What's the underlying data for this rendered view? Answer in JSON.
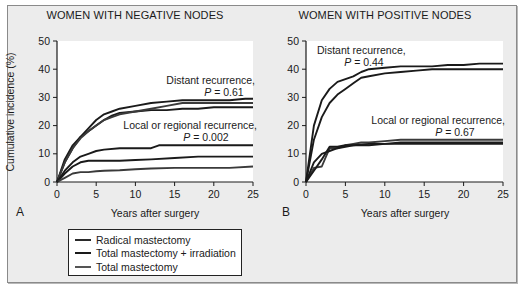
{
  "figure": {
    "legend": [
      {
        "label": "Radical mastectomy",
        "color": "#2a2a2a"
      },
      {
        "label": "Total mastectomy + irradiation",
        "color": "#1a1a1a"
      },
      {
        "label": "Total mastectomy",
        "color": "#555555"
      }
    ]
  },
  "chart_data": [
    {
      "type": "line",
      "panel": "A",
      "title": "WOMEN WITH NEGATIVE NODES",
      "xlabel": "Years after surgery",
      "ylabel": "Cumulative incidence (%)",
      "xlim": [
        0,
        25
      ],
      "ylim": [
        0,
        50
      ],
      "xticks": [
        0,
        5,
        10,
        15,
        20,
        25
      ],
      "yticks": [
        0,
        10,
        20,
        30,
        40,
        50
      ],
      "grid": false,
      "annotations": [
        {
          "text": "Distant recurrence,",
          "p_text": "P = 0.61"
        },
        {
          "text": "Local or regional recurrence,",
          "p_text": "P = 0.002"
        }
      ],
      "series": [
        {
          "name": "Distant - Radical mastectomy",
          "group": "distant",
          "x": [
            0,
            1,
            2,
            3,
            4,
            5,
            6,
            7,
            8,
            10,
            12,
            14,
            16,
            18,
            20,
            22,
            24,
            25
          ],
          "y": [
            0,
            8,
            13,
            16,
            19,
            22,
            24,
            25,
            26,
            27,
            28,
            28.5,
            29,
            29,
            29,
            29,
            29.5,
            29.5
          ]
        },
        {
          "name": "Distant - Total mastectomy + irradiation",
          "group": "distant",
          "x": [
            0,
            1,
            2,
            3,
            4,
            5,
            6,
            7,
            8,
            10,
            12,
            14,
            16,
            18,
            20,
            22,
            24,
            25
          ],
          "y": [
            0,
            7,
            12,
            16,
            18,
            20,
            22,
            23.5,
            24.5,
            25,
            25.5,
            25.5,
            26,
            26,
            26.5,
            26.5,
            26.5,
            26.5
          ]
        },
        {
          "name": "Distant - Total mastectomy",
          "group": "distant",
          "x": [
            0,
            1,
            2,
            3,
            4,
            5,
            6,
            7,
            8,
            10,
            12,
            14,
            16,
            18,
            20,
            22,
            24,
            25
          ],
          "y": [
            0,
            7,
            12,
            15.5,
            18,
            20,
            22,
            23,
            24,
            25,
            26,
            27,
            28,
            28,
            28,
            28,
            28,
            28
          ]
        },
        {
          "name": "Local/regional - Total mastectomy",
          "group": "local",
          "x": [
            0,
            1,
            2,
            3,
            4,
            5,
            6,
            8,
            10,
            12,
            13,
            15,
            18,
            20,
            22,
            25
          ],
          "y": [
            0,
            4,
            7,
            9,
            10,
            11,
            11.5,
            12,
            12,
            12,
            13,
            13,
            13,
            13,
            13,
            13
          ]
        },
        {
          "name": "Local/regional - Radical mastectomy",
          "group": "local",
          "x": [
            0,
            1,
            2,
            3,
            4,
            5,
            6,
            8,
            10,
            12,
            15,
            18,
            20,
            22,
            25
          ],
          "y": [
            0,
            3,
            5.5,
            7,
            7.5,
            7.5,
            7.5,
            7.5,
            7.8,
            8,
            8.5,
            9,
            9,
            9,
            9
          ]
        },
        {
          "name": "Local/regional - Total mastectomy + irradiation",
          "group": "local",
          "x": [
            0,
            1,
            2,
            3,
            4,
            5,
            6,
            8,
            10,
            12,
            15,
            18,
            20,
            22,
            25
          ],
          "y": [
            0,
            1.5,
            3,
            3.5,
            3.5,
            3.8,
            4,
            4.2,
            4.5,
            4.8,
            5,
            5,
            5,
            5,
            5.5
          ]
        }
      ]
    },
    {
      "type": "line",
      "panel": "B",
      "title": "WOMEN WITH POSITIVE NODES",
      "xlabel": "Years after surgery",
      "ylabel": "Cumulative incidence (%)",
      "xlim": [
        0,
        25
      ],
      "ylim": [
        0,
        50
      ],
      "xticks": [
        0,
        5,
        10,
        15,
        20,
        25
      ],
      "yticks": [
        0,
        10,
        20,
        30,
        40,
        50
      ],
      "grid": false,
      "annotations": [
        {
          "text": "Distant recurrence,",
          "p_text": "P = 0.44"
        },
        {
          "text": "Local or regional recurrence,",
          "p_text": "P = 0.67"
        }
      ],
      "series": [
        {
          "name": "Distant - upper curve",
          "group": "distant",
          "x": [
            0,
            1,
            2,
            3,
            4,
            5,
            6,
            7,
            8,
            10,
            12,
            14,
            16,
            18,
            20,
            22,
            25
          ],
          "y": [
            0,
            20,
            29,
            33,
            35.5,
            36.5,
            37.5,
            39,
            40,
            40.5,
            41,
            41,
            41,
            41.5,
            41.5,
            42,
            42
          ]
        },
        {
          "name": "Distant - lower curve",
          "group": "distant",
          "x": [
            0,
            1,
            2,
            3,
            4,
            5,
            6,
            7,
            8,
            10,
            12,
            14,
            16,
            18,
            20,
            22,
            25
          ],
          "y": [
            0,
            15,
            23,
            28,
            31,
            33,
            35,
            37,
            37.5,
            38.5,
            39,
            39.5,
            40,
            40,
            40,
            40,
            40
          ]
        },
        {
          "name": "Local/regional - upper curve",
          "group": "local",
          "x": [
            0,
            1,
            2,
            3,
            4,
            5,
            6,
            7,
            8,
            10,
            12,
            15,
            18,
            20,
            25
          ],
          "y": [
            0,
            5,
            5.5,
            12,
            12,
            13,
            13.5,
            14,
            14,
            14.5,
            15,
            15,
            15,
            15,
            15
          ]
        },
        {
          "name": "Local/regional - middle curve",
          "group": "local",
          "x": [
            0,
            1,
            2,
            3,
            4,
            5,
            6,
            8,
            10,
            12,
            15,
            18,
            20,
            25
          ],
          "y": [
            0,
            7,
            10,
            11,
            12,
            12.5,
            13,
            13,
            13.5,
            13.5,
            13.5,
            13.5,
            13.5,
            13.5
          ]
        },
        {
          "name": "Local/regional - lower curve",
          "group": "local",
          "x": [
            0,
            1,
            2,
            3,
            4,
            5,
            6,
            8,
            10,
            12,
            15,
            18,
            20,
            25
          ],
          "y": [
            0,
            4,
            8,
            12.5,
            12.5,
            13,
            13,
            13.5,
            13.5,
            14,
            14,
            14,
            14,
            14
          ]
        }
      ]
    }
  ]
}
